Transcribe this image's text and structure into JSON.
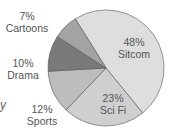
{
  "chart_data": {
    "type": "pie",
    "title": "",
    "categories": [
      "Sitcom",
      "Sci Fi",
      "Sports",
      "Drama",
      "Cartoons"
    ],
    "values": [
      48,
      23,
      12,
      10,
      7
    ],
    "unit": "%",
    "colors": [
      "#dedede",
      "#cfcfcf",
      "#bdbdbd",
      "#7a7a7a",
      "#a3a3a3"
    ],
    "labels": [
      {
        "pct": "48%",
        "name": "Sitcom"
      },
      {
        "pct": "23%",
        "name": "Sci Fi"
      },
      {
        "pct": "12%",
        "name": "Sports"
      },
      {
        "pct": "10%",
        "name": "Drama"
      },
      {
        "pct": "7%",
        "name": "Cartoons"
      }
    ],
    "legend": "none (labels placed inside/next to slices)"
  },
  "edge_fragment": "y"
}
